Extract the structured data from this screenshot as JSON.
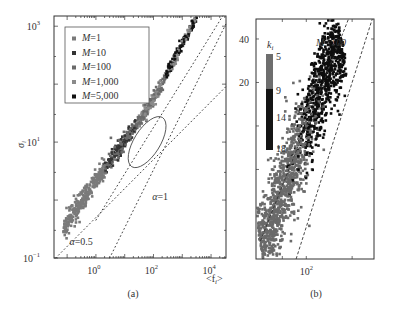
{
  "chart_data": [
    {
      "panel": "a",
      "type": "scatter",
      "xscale": "log",
      "yscale": "log",
      "xlabel": "<f_i>",
      "ylabel": "σ_i",
      "xlim": [
        0.035,
        33000
      ],
      "ylim": [
        0.1,
        1500
      ],
      "xticks": [
        {
          "value": 1,
          "label": "10",
          "exp": "0"
        },
        {
          "value": 100,
          "label": "10",
          "exp": "2"
        },
        {
          "value": 10000,
          "label": "10",
          "exp": "4"
        }
      ],
      "yticks": [
        {
          "value": 0.1,
          "label": "10",
          "exp": "−1"
        },
        {
          "value": 10,
          "label": "10",
          "exp": "1"
        },
        {
          "value": 1000,
          "label": "10",
          "exp": "3"
        }
      ],
      "legend": {
        "position": "top-left",
        "entries": [
          {
            "label": "M=1",
            "color": "#7a7a7a"
          },
          {
            "label": "M=10",
            "color": "#333333"
          },
          {
            "label": "M=100",
            "color": "#6a6a6a"
          },
          {
            "label": "M=1,000",
            "color": "#8a8a8a"
          },
          {
            "label": "M=5,000",
            "color": "#111111"
          }
        ]
      },
      "band": {
        "description": "scatter of sigma_i vs <f_i> for all M, collapsing onto one curve",
        "points": [
          [
            0.08,
            0.35
          ],
          [
            0.3,
            0.9
          ],
          [
            1,
            2.2
          ],
          [
            3,
            4.5
          ],
          [
            10,
            10
          ],
          [
            30,
            22
          ],
          [
            100,
            55
          ],
          [
            300,
            150
          ],
          [
            1000,
            500
          ],
          [
            3000,
            1400
          ],
          [
            8000,
            1500
          ]
        ]
      },
      "reference_lines": [
        {
          "label": "α=0.5",
          "slope": 0.5,
          "through": [
            0.04,
            0.1
          ],
          "style": "dotted"
        },
        {
          "label": "α=1",
          "slope": 1,
          "through": [
            3,
            0.1
          ],
          "style": "dotted"
        },
        {
          "label": "",
          "slope": 0.8,
          "through": [
            1,
            0.45
          ],
          "style": "dotted"
        }
      ],
      "annotations": [
        {
          "text": "α=0.5",
          "x": 0.12,
          "y": 0.17
        },
        {
          "text": "α=1",
          "x": 90,
          "y": 1.0
        }
      ],
      "ellipse": {
        "center": [
          60,
          10
        ],
        "note": "highlights M=100 region shown in panel (b)"
      },
      "caption": "(a)"
    },
    {
      "panel": "b",
      "type": "scatter",
      "xscale": "log",
      "yscale": "log",
      "title": "M=100",
      "xlim": [
        8,
        3000
      ],
      "ylim": [
        1.2,
        55
      ],
      "xticks": [
        {
          "value": 100,
          "label": "10",
          "exp": "2"
        }
      ],
      "yticks": [
        {
          "value": 20,
          "label": "20"
        },
        {
          "value": 40,
          "label": "40"
        }
      ],
      "colorbar": {
        "label": "k_i",
        "ticks": [
          5,
          9,
          14,
          18
        ],
        "colors": [
          "#6e6e6e",
          "#6e6e6e",
          "#1c1c1c",
          "#0a0a0a"
        ]
      },
      "band": {
        "description": "sigma_i vs <f_i> colored by degree k_i; low k gray, high k black",
        "points": [
          [
            10,
            1.5
          ],
          [
            20,
            2.5
          ],
          [
            40,
            4.5
          ],
          [
            80,
            8
          ],
          [
            150,
            14
          ],
          [
            300,
            25
          ],
          [
            600,
            40
          ]
        ]
      },
      "reference_lines": [
        {
          "slope": 1,
          "style": "dashed",
          "through": [
            60,
            1.2
          ]
        },
        {
          "slope": 0.8,
          "style": "dashed",
          "through": [
            10,
            1.6
          ]
        }
      ],
      "caption": "(b)"
    }
  ]
}
